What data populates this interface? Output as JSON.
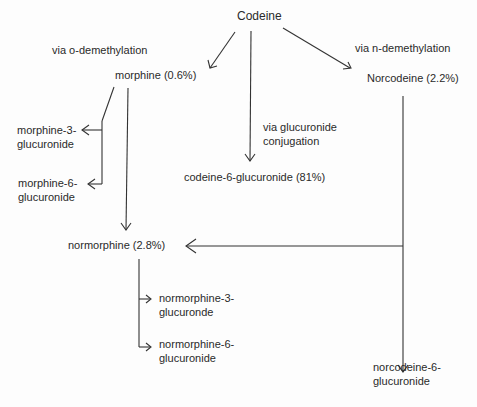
{
  "diagram": {
    "nodes": {
      "codeine": {
        "label": "Codeine"
      },
      "morphine": {
        "label": "morphine (0.6%)"
      },
      "norcodeine": {
        "label": "Norcodeine (2.2%)"
      },
      "codeine_6_glucuronide": {
        "label": "codeine-6-glucuronide (81%)"
      },
      "morphine_3_glucuronide": {
        "line1": "morphine-3-",
        "line2": "glucuronide"
      },
      "morphine_6_glucuronide": {
        "line1": "morphine-6-",
        "line2": "glucuronide"
      },
      "normorphine": {
        "label": "normorphine (2.8%)"
      },
      "normorphine_3_glucuronide": {
        "line1": "normorphine-3-",
        "line2": "glucuronde"
      },
      "normorphine_6_glucuronide": {
        "line1": "normorphine-6-",
        "line2": "glucuronide"
      },
      "norcodeine_6_glucuronide": {
        "line1": "norcodeine-6-",
        "line2": "glucuronide"
      }
    },
    "edge_labels": {
      "o_demethylation": "via o-demethylation",
      "n_demethylation": "via n-demethylation",
      "glucuronide_conjugation": {
        "line1": "via glucuronide",
        "line2": "conjugation"
      }
    },
    "edges": [
      {
        "from": "codeine",
        "to": "morphine",
        "label": "via o-demethylation"
      },
      {
        "from": "codeine",
        "to": "codeine_6_glucuronide",
        "label": "via glucuronide conjugation"
      },
      {
        "from": "codeine",
        "to": "norcodeine",
        "label": "via n-demethylation"
      },
      {
        "from": "morphine",
        "to": "morphine_3_glucuronide"
      },
      {
        "from": "morphine",
        "to": "morphine_6_glucuronide"
      },
      {
        "from": "morphine",
        "to": "normorphine"
      },
      {
        "from": "norcodeine",
        "to": "normorphine"
      },
      {
        "from": "norcodeine",
        "to": "norcodeine_6_glucuronide"
      },
      {
        "from": "normorphine",
        "to": "normorphine_3_glucuronide"
      },
      {
        "from": "normorphine",
        "to": "normorphine_6_glucuronide"
      }
    ]
  }
}
